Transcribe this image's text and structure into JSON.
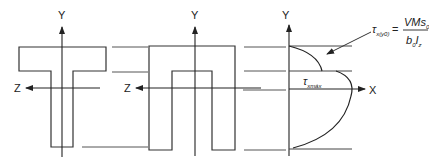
{
  "diagram": {
    "sections": [
      {
        "name": "T-section",
        "axis_y": "Y",
        "axis_z": "Z"
      },
      {
        "name": "Inverted-U section",
        "axis_y": "Y",
        "axis_z": "Z"
      },
      {
        "name": "Shear stress distribution",
        "axis_y": "Y",
        "axis_x": "X"
      }
    ],
    "labels": {
      "y1": "Y",
      "z1": "Z",
      "y2": "Y",
      "z2": "Z",
      "y3": "Y",
      "x3": "X",
      "tau_max_symbol": "τ",
      "tau_max_sub": "xmáx",
      "formula_lhs_symbol": "τ",
      "formula_lhs_sub": "x(y0)",
      "formula_eq": "=",
      "formula_num": "VMs",
      "formula_num_sub": "0",
      "formula_den_b": "b",
      "formula_den_b_sub": "0",
      "formula_den_I": "I",
      "formula_den_I_sub": "z"
    }
  }
}
